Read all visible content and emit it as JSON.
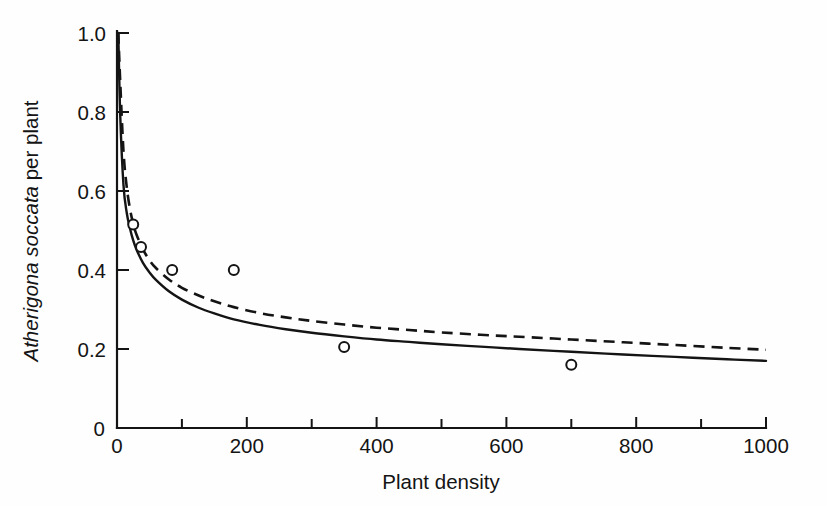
{
  "figure": {
    "background": "#fefefe",
    "ink_color": "#141414"
  },
  "chart_data": {
    "type": "scatter",
    "title": "",
    "subtitle": "",
    "xlabel": "Plant density",
    "ylabel_italic": "Atherigona soccata",
    "ylabel_roman": " per plant",
    "ylabel": "Atherigona soccata per plant",
    "xlim": [
      0,
      1000
    ],
    "ylim": [
      0,
      1.0
    ],
    "grid": false,
    "legend": "none",
    "xticks": [
      0,
      100,
      200,
      300,
      400,
      500,
      600,
      700,
      800,
      900,
      1000
    ],
    "xticklabels": [
      "0",
      "",
      "200",
      "",
      "400",
      "",
      "600",
      "",
      "800",
      "",
      "1000"
    ],
    "yticks": [
      0,
      0.2,
      0.4,
      0.6,
      0.8,
      1.0
    ],
    "yticklabels": [
      "0",
      "0.2",
      "0.4",
      "0.6",
      "0.8",
      "1.0"
    ],
    "points": {
      "name": "Observed",
      "marker": "open-circle",
      "x": [
        25,
        37,
        85,
        180,
        350,
        700
      ],
      "y": [
        0.515,
        0.458,
        0.4,
        0.4,
        0.205,
        0.16
      ]
    },
    "series": [
      {
        "name": "Fitted curve (solid)",
        "style": "solid",
        "x": [
          2,
          5,
          10,
          15,
          20,
          25,
          30,
          40,
          50,
          60,
          80,
          100,
          125,
          150,
          180,
          220,
          260,
          300,
          350,
          400,
          450,
          500,
          560,
          620,
          700,
          780,
          860,
          940,
          1000
        ],
        "y": [
          1.0,
          0.79,
          0.615,
          0.545,
          0.505,
          0.475,
          0.452,
          0.418,
          0.394,
          0.375,
          0.346,
          0.325,
          0.305,
          0.29,
          0.275,
          0.261,
          0.25,
          0.241,
          0.232,
          0.224,
          0.218,
          0.212,
          0.206,
          0.2,
          0.193,
          0.186,
          0.18,
          0.174,
          0.17
        ]
      },
      {
        "name": "Fitted curve (dashed)",
        "style": "dashed",
        "x": [
          2,
          5,
          10,
          15,
          20,
          25,
          30,
          40,
          50,
          60,
          80,
          100,
          125,
          150,
          180,
          220,
          260,
          300,
          350,
          400,
          450,
          500,
          560,
          620,
          700,
          780,
          860,
          940,
          1000
        ],
        "y": [
          1.0,
          0.875,
          0.7,
          0.61,
          0.555,
          0.517,
          0.49,
          0.452,
          0.425,
          0.405,
          0.376,
          0.355,
          0.336,
          0.321,
          0.306,
          0.291,
          0.28,
          0.271,
          0.262,
          0.254,
          0.248,
          0.242,
          0.236,
          0.231,
          0.224,
          0.217,
          0.21,
          0.203,
          0.198
        ]
      }
    ]
  }
}
